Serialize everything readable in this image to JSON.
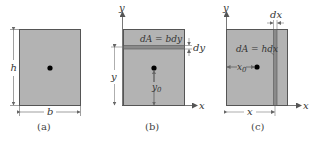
{
  "colors": {
    "fill": "#b3b3b3",
    "strip": "#8a8a8a",
    "stroke": "#555555",
    "dimension": "#777777",
    "centroid": "#000000"
  },
  "figures": [
    {
      "id": "a",
      "caption": "(a)",
      "labels": {
        "height": "h",
        "width": "b"
      }
    },
    {
      "id": "b",
      "caption": "(b)",
      "labels": {
        "y_axis": "y",
        "x_axis": "x",
        "element": "dA = bdy",
        "strip_thickness": "dy",
        "strip_position": "y",
        "centroid_distance": "y",
        "centroid_distance_sub": "0"
      }
    },
    {
      "id": "c",
      "caption": "(c)",
      "labels": {
        "y_axis": "y",
        "x_axis": "x",
        "element": "dA = hdx",
        "strip_thickness": "dx",
        "strip_position": "x",
        "centroid_distance": "x",
        "centroid_distance_sub": "0"
      }
    }
  ]
}
